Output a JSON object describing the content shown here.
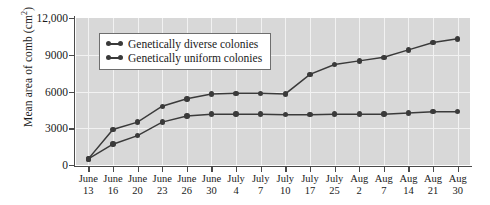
{
  "chart_data": {
    "type": "line",
    "title": "",
    "xlabel": "",
    "ylabel": "Mean area of comb (cm",
    "ylabel_sup": "2",
    "ylabel_suffix": ")",
    "ylim": [
      0,
      12000
    ],
    "yticks": [
      "0",
      "3000",
      "6000",
      "9000",
      "12,000"
    ],
    "ytick_values": [
      0,
      3000,
      6000,
      9000,
      12000
    ],
    "grid": true,
    "grid_color": "#f2f2f2",
    "plot_background": "#d8d8d8",
    "marker_color": "#3a3a3a",
    "line_color": "#3a3a3a",
    "legend_position": "upper-left-inside",
    "categories": [
      {
        "month": "June",
        "day": "13"
      },
      {
        "month": "June",
        "day": "16"
      },
      {
        "month": "June",
        "day": "20"
      },
      {
        "month": "June",
        "day": "23"
      },
      {
        "month": "June",
        "day": "26"
      },
      {
        "month": "June",
        "day": "30"
      },
      {
        "month": "July",
        "day": "4"
      },
      {
        "month": "July",
        "day": "7"
      },
      {
        "month": "July",
        "day": "10"
      },
      {
        "month": "July",
        "day": "17"
      },
      {
        "month": "July",
        "day": "25"
      },
      {
        "month": "Aug",
        "day": "2"
      },
      {
        "month": "Aug",
        "day": "7"
      },
      {
        "month": "Aug",
        "day": "14"
      },
      {
        "month": "Aug",
        "day": "21"
      },
      {
        "month": "Aug",
        "day": "30"
      }
    ],
    "series": [
      {
        "name": "Genetically diverse colonies",
        "values": [
          500,
          2900,
          3500,
          4800,
          5400,
          5800,
          5850,
          5850,
          5800,
          7400,
          8200,
          8500,
          8800,
          9400,
          10000,
          10300
        ]
      },
      {
        "name": "Genetically uniform colonies",
        "values": [
          500,
          1700,
          2400,
          3500,
          4000,
          4150,
          4150,
          4150,
          4100,
          4100,
          4150,
          4150,
          4150,
          4250,
          4350,
          4350
        ]
      }
    ],
    "legend": [
      "Genetically diverse colonies",
      "Genetically uniform colonies"
    ]
  }
}
